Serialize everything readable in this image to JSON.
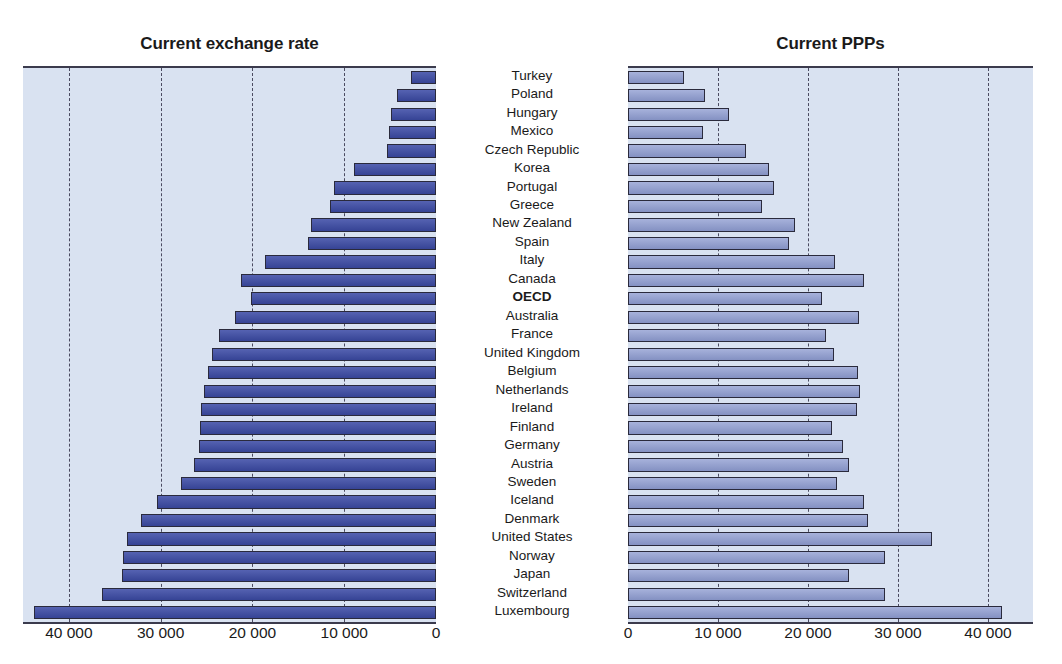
{
  "figure": {
    "left_panel_title": "Current exchange rate",
    "right_panel_title": "Current PPPs"
  },
  "chart_data": {
    "type": "bar",
    "title": "",
    "subtitle": "",
    "orientation": "horizontal",
    "layout": "back-to-back paired horizontal bar chart",
    "grid": true,
    "legend": null,
    "panels": [
      {
        "name": "left",
        "title": "Current exchange rate",
        "direction": "right-to-left",
        "xlabel": "",
        "ylabel": "",
        "xlim": [
          0,
          45000
        ],
        "axis_reversed": true,
        "tick_labels": [
          "40 000",
          "30 000",
          "20 000",
          "10 000",
          "0"
        ],
        "tick_values": [
          40000,
          30000,
          20000,
          10000,
          0
        ],
        "bar_color": "#3c4ba6"
      },
      {
        "name": "right",
        "title": "Current PPPs",
        "direction": "left-to-right",
        "xlabel": "",
        "ylabel": "",
        "xlim": [
          0,
          45000
        ],
        "axis_reversed": false,
        "tick_labels": [
          "0",
          "10 000",
          "20 000",
          "30 000",
          "40 000"
        ],
        "tick_values": [
          0,
          10000,
          20000,
          30000,
          40000
        ],
        "bar_color": "#8e9cd1"
      }
    ],
    "categories": [
      "Turkey",
      "Poland",
      "Hungary",
      "Mexico",
      "Czech Republic",
      "Korea",
      "Portugal",
      "Greece",
      "New Zealand",
      "Spain",
      "Italy",
      "Canada",
      "OECD",
      "Australia",
      "France",
      "United Kingdom",
      "Belgium",
      "Netherlands",
      "Ireland",
      "Finland",
      "Germany",
      "Austria",
      "Sweden",
      "Iceland",
      "Denmark",
      "United States",
      "Norway",
      "Japan",
      "Switzerland",
      "Luxembourg"
    ],
    "highlighted_categories": [
      "OECD"
    ],
    "series": [
      {
        "name": "Current exchange rate",
        "panel": "left",
        "values": [
          2700,
          4200,
          4900,
          5100,
          5300,
          8900,
          11100,
          11500,
          13600,
          14000,
          18600,
          21300,
          20200,
          21900,
          23700,
          24400,
          24800,
          25300,
          25600,
          25700,
          25800,
          26400,
          27800,
          30400,
          32100,
          33700,
          34100,
          34200,
          36400,
          43800
        ]
      },
      {
        "name": "Current PPPs",
        "panel": "right",
        "values": [
          6200,
          8500,
          11200,
          8300,
          13100,
          15700,
          16200,
          14900,
          18500,
          17900,
          23000,
          26200,
          21600,
          25700,
          22000,
          22900,
          25500,
          25800,
          25400,
          22700,
          23900,
          24600,
          23200,
          26200,
          26700,
          33800,
          28600,
          24500,
          28600,
          41500
        ]
      }
    ]
  }
}
